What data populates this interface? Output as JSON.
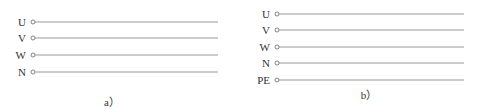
{
  "diagrams": [
    {
      "caption": "a）",
      "lines": [
        {
          "label": "U"
        },
        {
          "label": "V"
        },
        {
          "label": "W"
        },
        {
          "label": "N"
        }
      ]
    },
    {
      "caption": "b）",
      "lines": [
        {
          "label": "U"
        },
        {
          "label": "V"
        },
        {
          "label": "W"
        },
        {
          "label": "N"
        },
        {
          "label": "PE"
        }
      ]
    }
  ],
  "colors": {
    "line": "#999999",
    "text": "#333333"
  }
}
